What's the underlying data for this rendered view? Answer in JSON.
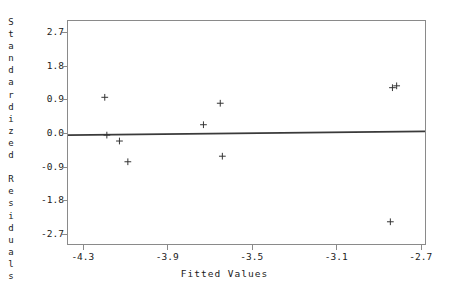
{
  "chart_data": {
    "type": "scatter",
    "title": "",
    "xlabel": "Fitted Values",
    "ylabel": "Standardized Residuals",
    "xlim": [
      -4.375,
      -2.675
    ],
    "ylim": [
      -3.0,
      3.02
    ],
    "xticks": [
      -4.3,
      -3.9,
      -3.5,
      -3.1,
      -2.7
    ],
    "xtick_labels": [
      "-4.3",
      "-3.9",
      "-3.5",
      "-3.1",
      "-2.7"
    ],
    "yticks": [
      2.7,
      1.8,
      0.9,
      0.0,
      -0.9,
      -1.8,
      -2.7
    ],
    "ytick_labels": [
      "2.7",
      "1.8",
      "0.9",
      "0.0",
      "-0.9",
      "-1.8",
      "-2.7"
    ],
    "grid": false,
    "legend": null,
    "marker": "plus",
    "marker_color": "#333333",
    "points": [
      {
        "x": -4.2,
        "y": 0.96
      },
      {
        "x": -4.19,
        "y": -0.06
      },
      {
        "x": -4.13,
        "y": -0.22
      },
      {
        "x": -4.09,
        "y": -0.78
      },
      {
        "x": -3.73,
        "y": 0.22
      },
      {
        "x": -3.65,
        "y": 0.8
      },
      {
        "x": -3.64,
        "y": -0.63
      },
      {
        "x": -2.83,
        "y": 1.22
      },
      {
        "x": -2.81,
        "y": 1.27
      },
      {
        "x": -2.84,
        "y": -2.4
      }
    ],
    "reference_line": {
      "type": "line",
      "color": "#3a3a3a",
      "x": [
        -4.375,
        -2.675
      ],
      "y": [
        -0.06,
        0.04
      ]
    }
  },
  "axis": {
    "y_title_chars": [
      "S",
      "t",
      "a",
      "n",
      "d",
      "a",
      "r",
      "d",
      "i",
      "z",
      "e",
      "d",
      "",
      "R",
      "e",
      "s",
      "i",
      "d",
      "u",
      "a",
      "l",
      "s"
    ]
  }
}
